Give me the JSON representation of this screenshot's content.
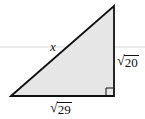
{
  "diagram": {
    "type": "right-triangle",
    "fill_color": "#e6e6e6",
    "stroke_color": "#111111",
    "guide_line_color": "#c8c8c8",
    "vertices": {
      "bottom_left": [
        11,
        96
      ],
      "top_right": [
        114,
        6
      ],
      "bottom_right": [
        114,
        96
      ]
    },
    "right_angle_at": "bottom_right",
    "labels": {
      "hypotenuse": "x",
      "vertical_leg": "20",
      "horizontal_leg": "29"
    }
  }
}
